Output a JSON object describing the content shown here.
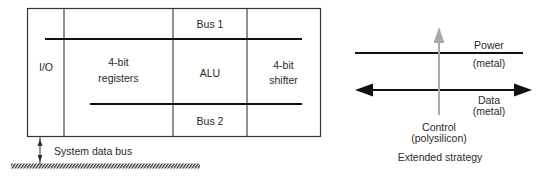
{
  "left_diagram": {
    "columns": {
      "io": "I/O",
      "registers_line1": "4-bit",
      "registers_line2": "registers",
      "bus1": "Bus 1",
      "alu": "ALU",
      "bus2": "Bus 2",
      "shifter_line1": "4-bit",
      "shifter_line2": "shifter"
    },
    "system_bus_label": "System data bus"
  },
  "right_diagram": {
    "power_label": "Power",
    "power_material": "(metal)",
    "data_label": "Data",
    "data_material": "(metal)",
    "control_label": "Control",
    "control_material": "(polysilicon)",
    "caption": "Extended strategy"
  },
  "colors": {
    "line": "#111111",
    "box": "#333333",
    "control_arrow": "#a8a8a8"
  }
}
